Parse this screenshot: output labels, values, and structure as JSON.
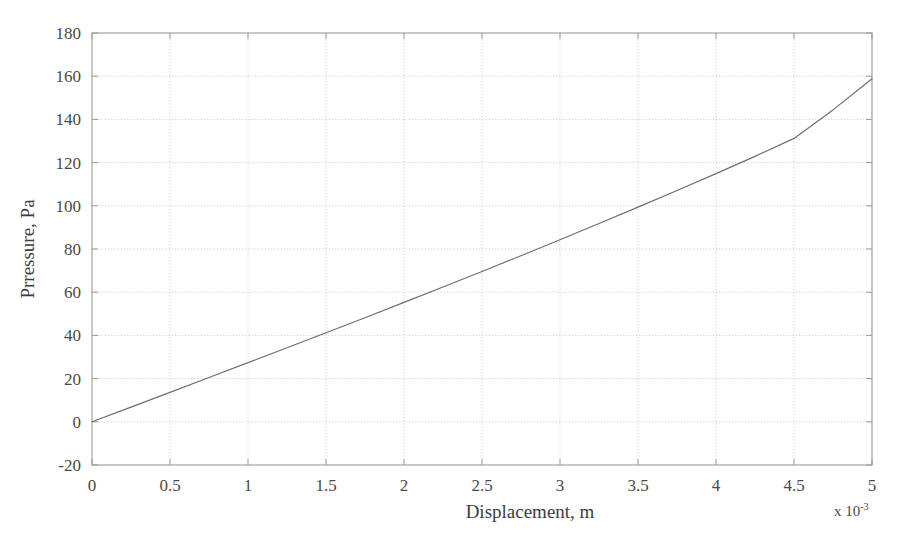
{
  "chart_data": {
    "type": "line",
    "title": "",
    "xlabel": "Displacement, m",
    "ylabel": "Prressure, Pa",
    "x_multiplier_label": "x 10",
    "x_multiplier_exponent": "-3",
    "x_multiplier_full": "x 10^-3",
    "xlim": [
      0,
      5
    ],
    "ylim": [
      -20,
      180
    ],
    "x_tick_labels": [
      "0",
      "0.5",
      "1",
      "1.5",
      "2",
      "2.5",
      "3",
      "3.5",
      "4",
      "4.5",
      "5"
    ],
    "x_tick_values": [
      0,
      0.5,
      1,
      1.5,
      2,
      2.5,
      3,
      3.5,
      4,
      4.5,
      5
    ],
    "y_tick_labels": [
      "-20",
      "0",
      "20",
      "40",
      "60",
      "80",
      "100",
      "120",
      "140",
      "160",
      "180"
    ],
    "y_tick_values": [
      -20,
      0,
      20,
      40,
      60,
      80,
      100,
      120,
      140,
      160,
      180
    ],
    "grid": true,
    "grid_style": "dotted",
    "legend": null,
    "series": [
      {
        "name": "Pressure vs Displacement",
        "color": "#6e6e6e",
        "line_width": 1.2,
        "x": [
          0,
          0.25,
          0.5,
          0.75,
          1.0,
          1.25,
          1.5,
          1.75,
          2.0,
          2.25,
          2.5,
          2.75,
          3.0,
          3.25,
          3.5,
          3.75,
          4.0,
          4.25,
          4.5,
          4.75,
          5.0
        ],
        "y": [
          0,
          6.8,
          13.6,
          20.5,
          27.4,
          34.3,
          41.2,
          48.2,
          55.3,
          62.4,
          69.6,
          76.9,
          84.3,
          91.8,
          99.4,
          107.1,
          114.9,
          122.9,
          131.2,
          144.4,
          158.8
        ]
      }
    ]
  },
  "colors": {
    "axis": "#9a9a9a",
    "grid": "#bdbdbd",
    "line": "#6e6e6e",
    "text": "#3d3d3d",
    "background": "#ffffff"
  },
  "axes": {
    "x_axis_name": "displacement-axis",
    "y_axis_name": "pressure-axis"
  }
}
